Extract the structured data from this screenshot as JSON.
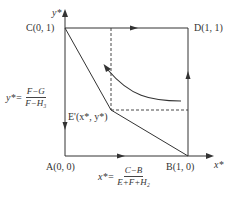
{
  "diagram": {
    "type": "phase-diagram",
    "axes": {
      "x_label": "x*",
      "y_label": "y*"
    },
    "points": {
      "A": {
        "label": "A(0, 0)",
        "coords": [
          0,
          0
        ]
      },
      "B": {
        "label": "B(1, 0)",
        "coords": [
          1,
          0
        ]
      },
      "C": {
        "label": "C(0, 1)",
        "coords": [
          0,
          1
        ]
      },
      "D": {
        "label": "D(1, 1)",
        "coords": [
          1,
          1
        ]
      },
      "E": {
        "label": "E'(x*, y*)"
      }
    },
    "equations": {
      "y_star": {
        "lhs": "y*=",
        "numerator": "F−G",
        "denominator": "F−H₃"
      },
      "x_star": {
        "lhs": "x*=",
        "numerator": "C−B",
        "denominator": "E+F+H₂"
      }
    },
    "colors": {
      "line": "#333333",
      "text": "#333333",
      "background": "#ffffff"
    }
  }
}
